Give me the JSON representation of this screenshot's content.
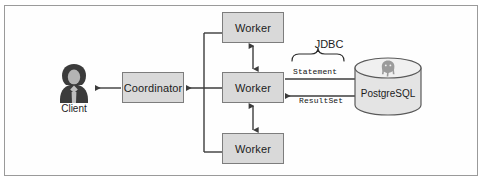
{
  "diagram": {
    "frame": {
      "border_color": "#9a9a9a",
      "background": "#fefefe"
    },
    "style": {
      "box_fill": "#d9d9d9",
      "box_border": "#7d7d7d",
      "line_color": "#3c3c3c",
      "text_color": "#1c1c1c"
    },
    "nodes": {
      "client": {
        "label": "Client",
        "icon": "user-avatar-icon"
      },
      "coordinator": {
        "label": "Coordinator"
      },
      "worker_top": {
        "label": "Worker"
      },
      "worker_middle": {
        "label": "Worker"
      },
      "worker_bottom": {
        "label": "Worker"
      },
      "database": {
        "label": "PostgreSQL",
        "icon": "postgresql-elephant-icon",
        "shape": "cylinder"
      }
    },
    "edges": {
      "jdbc": {
        "label": "JDBC",
        "brace": "curly-brace-down"
      },
      "statement": {
        "label": "Statement",
        "direction": "worker-to-database"
      },
      "resultset": {
        "label": "ResultSet",
        "direction": "database-to-worker"
      },
      "coordinator_to_client": {
        "direction": "coordinator-to-client"
      },
      "workers_to_coordinator": {
        "direction": "workers-to-coordinator"
      },
      "worker_top_link": {
        "direction": "bidirectional"
      },
      "worker_bottom_link": {
        "direction": "bidirectional"
      }
    }
  }
}
